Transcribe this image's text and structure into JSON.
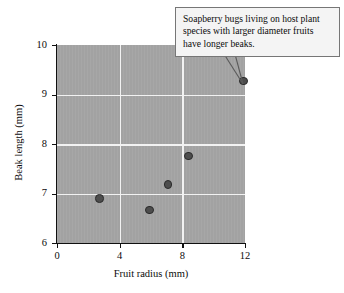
{
  "chart_data": {
    "type": "scatter",
    "title": "",
    "xlabel": "Fruit radius (mm)",
    "ylabel": "Beak length (mm)",
    "xlim": [
      0,
      12
    ],
    "ylim": [
      6,
      10
    ],
    "xticks": [
      0,
      4,
      8,
      12
    ],
    "yticks": [
      6,
      7,
      8,
      9,
      10
    ],
    "xtick_labels": [
      "0",
      "4",
      "8",
      "12"
    ],
    "ytick_labels": [
      "6",
      "7",
      "8",
      "9",
      "10"
    ],
    "grid": "on",
    "grid_color": "#f2f2f2",
    "plot_background": "#a2a2a2",
    "marker_color": "#4d4d4d",
    "marker_edge_color": "#2b2b2b",
    "legend": "none",
    "points": [
      {
        "x": 2.7,
        "y": 6.9
      },
      {
        "x": 5.9,
        "y": 6.67
      },
      {
        "x": 7.1,
        "y": 7.18
      },
      {
        "x": 8.4,
        "y": 7.76
      },
      {
        "x": 11.9,
        "y": 9.27
      }
    ],
    "annotations": [
      {
        "text": "Soapberry bugs living on host plant species with larger diameter fruits have longer beaks.",
        "points_to": {
          "x": 11.9,
          "y": 9.27
        }
      }
    ]
  }
}
